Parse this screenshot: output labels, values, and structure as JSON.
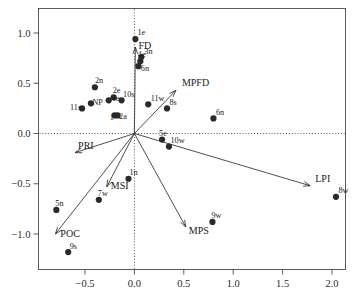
{
  "chart_data": {
    "type": "scatter",
    "title": "",
    "subtitle": "",
    "xlabel": "",
    "ylabel": "",
    "xlim": [
      -0.92,
      2.22
    ],
    "ylim": [
      -1.36,
      1.18
    ],
    "grid": false,
    "legend": "none",
    "xticks": [
      "-0.5",
      "0.0",
      "0.5",
      "1.0",
      "1.5",
      "2.0"
    ],
    "xtickvalues": [
      -0.5,
      0.0,
      0.5,
      1.0,
      1.5,
      2.0
    ],
    "yticks": [
      "1.0",
      "0.5",
      "0.0",
      "-0.5",
      "-1.0"
    ],
    "ytickvalues": [
      1.0,
      0.5,
      0.0,
      -0.5,
      -1.0
    ],
    "zero_reference_lines": {
      "x": 0.0,
      "y": 0.0,
      "style": "dotted"
    },
    "point_color": "#2a2a2a",
    "vector_color": "#2f2f2f",
    "points": [
      {
        "label": "1e",
        "x": 0.01,
        "y": 0.94
      },
      {
        "label": "3n",
        "x": 0.07,
        "y": 0.76
      },
      {
        "label": "4e",
        "x": 0.06,
        "y": 0.72
      },
      {
        "label": "6n",
        "x": 0.04,
        "y": 0.67
      },
      {
        "label": "2n",
        "x": -0.4,
        "y": 0.46
      },
      {
        "label": "2e",
        "x": -0.21,
        "y": 0.36
      },
      {
        "label": "4e",
        "x": -0.26,
        "y": 0.33
      },
      {
        "label": "10s",
        "x": -0.13,
        "y": 0.33
      },
      {
        "label": "11w",
        "x": 0.14,
        "y": 0.29
      },
      {
        "label": "11s",
        "x": -0.53,
        "y": 0.25
      },
      {
        "label": "NP",
        "x": -0.44,
        "y": 0.3
      },
      {
        "label": "1",
        "x": -0.2,
        "y": 0.18
      },
      {
        "label": "2a",
        "x": -0.17,
        "y": 0.18
      },
      {
        "label": "8s",
        "x": 0.33,
        "y": 0.25
      },
      {
        "label": "6n",
        "x": 0.8,
        "y": 0.15
      },
      {
        "label": "5e",
        "x": 0.28,
        "y": -0.06
      },
      {
        "label": "10w",
        "x": 0.35,
        "y": -0.13
      },
      {
        "label": "1n",
        "x": -0.06,
        "y": -0.45
      },
      {
        "label": "7w",
        "x": -0.36,
        "y": -0.66
      },
      {
        "label": "5n",
        "x": -0.79,
        "y": -0.76
      },
      {
        "label": "9w",
        "x": 0.79,
        "y": -0.88
      },
      {
        "label": "8w",
        "x": 2.04,
        "y": -0.63
      },
      {
        "label": "9s",
        "x": -0.67,
        "y": -1.18
      }
    ],
    "vectors": [
      {
        "label": "FD",
        "x": 0.01,
        "y": 0.86,
        "label_dx": 3,
        "label_dy": 2
      },
      {
        "label": "MPFD",
        "x": 0.42,
        "y": 0.43,
        "label_dx": 6,
        "label_dy": -4
      },
      {
        "label": "PRI",
        "x": -0.6,
        "y": -0.19,
        "label_dx": 3,
        "label_dy": -4
      },
      {
        "label": "LPI",
        "x": 1.78,
        "y": -0.52,
        "label_dx": 5,
        "label_dy": -4
      },
      {
        "label": "POC",
        "x": -0.8,
        "y": -1.0,
        "label_dx": 5,
        "label_dy": 3
      },
      {
        "label": "MSI",
        "x": -0.28,
        "y": -0.53,
        "label_dx": 4,
        "label_dy": 2
      },
      {
        "label": "MPS",
        "x": 0.52,
        "y": -0.93,
        "label_dx": 3,
        "label_dy": 7
      }
    ]
  }
}
